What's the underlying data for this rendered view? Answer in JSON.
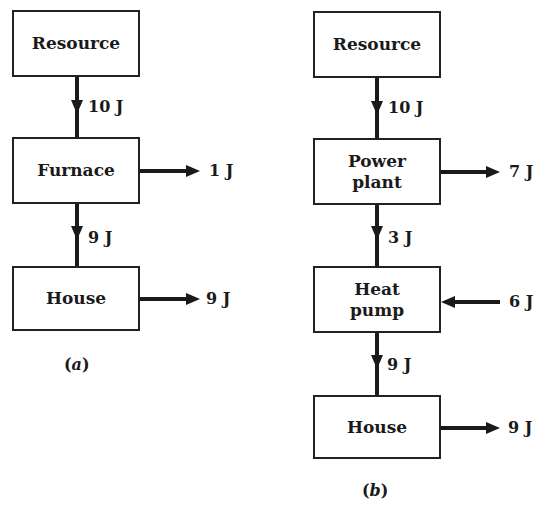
{
  "diagram_a": {
    "caption_open": "(",
    "caption_letter": "a",
    "caption_close": ")",
    "nodes": {
      "resource": "Resource",
      "furnace": "Furnace",
      "house": "House"
    },
    "flows": {
      "resource_to_furnace": "10 J",
      "furnace_loss": "1 J",
      "furnace_to_house": "9 J",
      "house_out": "9 J"
    }
  },
  "diagram_b": {
    "caption_open": "(",
    "caption_letter": "b",
    "caption_close": ")",
    "nodes": {
      "resource": "Resource",
      "power_plant_line1": "Power",
      "power_plant_line2": "plant",
      "heat_pump_line1": "Heat",
      "heat_pump_line2": "pump",
      "house": "House"
    },
    "flows": {
      "resource_to_power_plant": "10 J",
      "power_plant_loss": "7 J",
      "power_plant_to_heat_pump": "3 J",
      "environment_to_heat_pump": "6 J",
      "heat_pump_to_house": "9 J",
      "house_out": "9 J"
    }
  }
}
